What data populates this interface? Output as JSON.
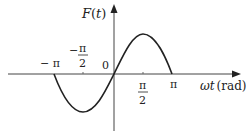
{
  "diagram": {
    "y_axis_label": "F(t)",
    "y_axis_label_parts": {
      "func": "F",
      "open": "(",
      "var": "t",
      "close": ")"
    },
    "x_axis_label": "ωt (rad)",
    "x_axis_label_parts": {
      "var": "ωt",
      "unit": "(rad)"
    },
    "origin_label": "0",
    "ticks": [
      {
        "id": "neg-pi",
        "label": "− π",
        "value": "-π"
      },
      {
        "id": "neg-half-pi",
        "label_sign": "−",
        "numerator": "π",
        "denominator": "2",
        "value": "-π/2"
      },
      {
        "id": "half-pi",
        "numerator": "π",
        "denominator": "2",
        "value": "π/2"
      },
      {
        "id": "pi",
        "label": "π",
        "value": "π"
      }
    ],
    "curve": {
      "type": "sine",
      "domain": "[-π, π]",
      "description": "One full period of a sine wave: negative half from -π to 0 (minimum at -π/2), positive half from 0 to π (maximum at π/2)"
    },
    "colors": {
      "axis": "#333333",
      "curve": "#222222",
      "text": "#222222"
    }
  }
}
